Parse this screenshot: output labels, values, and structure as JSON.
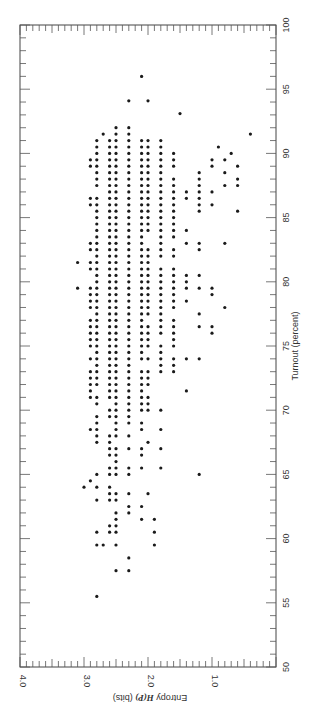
{
  "chart_data": {
    "type": "scatter",
    "title": "",
    "orientation": "rotated-90-clockwise",
    "xlabel": "Turnout (percent)",
    "ylabel": "Entropy H(P) (bits)",
    "xlim": [
      50,
      100
    ],
    "ylim": [
      0,
      4.0
    ],
    "x_ticks": [
      50,
      55,
      60,
      65,
      70,
      75,
      80,
      85,
      90,
      95,
      100
    ],
    "y_ticks": [
      1.0,
      2.0,
      3.0,
      4.0
    ],
    "y_tick_labels": [
      "1.0",
      "2.0",
      "3.0",
      "4.0"
    ],
    "x_tick_labels": [
      "50",
      "55",
      "60",
      "65",
      "70",
      "75",
      "80",
      "85",
      "90",
      "95",
      "100"
    ],
    "grid": false,
    "legend": null,
    "rows": [
      {
        "turnout": 96.0,
        "entropy": [
          2.1
        ]
      },
      {
        "turnout": 94.1,
        "entropy": [
          2.3,
          2.0
        ]
      },
      {
        "turnout": 93.1,
        "entropy": [
          1.5
        ]
      },
      {
        "turnout": 92.0,
        "entropy": [
          2.3,
          2.5
        ]
      },
      {
        "turnout": 91.5,
        "entropy": [
          2.3,
          2.5,
          2.7,
          0.4
        ]
      },
      {
        "turnout": 91.0,
        "entropy": [
          2.8,
          2.6,
          2.5,
          2.3,
          2.1,
          2.0,
          1.8
        ]
      },
      {
        "turnout": 90.5,
        "entropy": [
          2.8,
          2.6,
          2.5,
          2.3,
          2.1,
          2.0,
          1.8,
          0.9
        ]
      },
      {
        "turnout": 90.0,
        "entropy": [
          2.8,
          2.6,
          2.5,
          2.3,
          2.1,
          2.0,
          1.8,
          1.6,
          0.7
        ]
      },
      {
        "turnout": 89.5,
        "entropy": [
          2.9,
          2.8,
          2.6,
          2.5,
          2.3,
          2.1,
          2.0,
          1.8,
          1.6,
          1.0,
          0.8
        ]
      },
      {
        "turnout": 89.0,
        "entropy": [
          2.9,
          2.8,
          2.6,
          2.5,
          2.3,
          2.1,
          2.0,
          1.8,
          1.6,
          1.0,
          0.6
        ]
      },
      {
        "turnout": 88.5,
        "entropy": [
          2.8,
          2.6,
          2.5,
          2.3,
          2.1,
          2.0,
          1.8,
          1.2,
          0.8
        ]
      },
      {
        "turnout": 88.0,
        "entropy": [
          2.8,
          2.6,
          2.5,
          2.3,
          2.1,
          2.0,
          1.8,
          1.6,
          1.2,
          0.6
        ]
      },
      {
        "turnout": 87.5,
        "entropy": [
          2.8,
          2.6,
          2.5,
          2.3,
          2.1,
          2.0,
          1.8,
          1.6,
          1.2,
          0.8,
          0.6
        ]
      },
      {
        "turnout": 87.0,
        "entropy": [
          2.6,
          2.5,
          2.3,
          2.1,
          2.0,
          1.8,
          1.6,
          1.4,
          1.2,
          1.0
        ]
      },
      {
        "turnout": 86.5,
        "entropy": [
          2.9,
          2.8,
          2.6,
          2.5,
          2.3,
          2.1,
          2.0,
          1.8,
          1.6,
          1.4,
          1.2
        ]
      },
      {
        "turnout": 86.0,
        "entropy": [
          2.9,
          2.8,
          2.6,
          2.5,
          2.3,
          2.1,
          2.0,
          1.8,
          1.6,
          1.2,
          1.0
        ]
      },
      {
        "turnout": 85.5,
        "entropy": [
          2.8,
          2.6,
          2.5,
          2.3,
          2.1,
          2.0,
          1.8,
          1.6,
          1.2,
          0.6
        ]
      },
      {
        "turnout": 85.0,
        "entropy": [
          2.8,
          2.6,
          2.5,
          2.3,
          2.1,
          2.0,
          1.8,
          1.6
        ]
      },
      {
        "turnout": 84.5,
        "entropy": [
          2.8,
          2.6,
          2.5,
          2.3,
          2.1,
          2.0,
          1.8,
          1.6
        ]
      },
      {
        "turnout": 84.0,
        "entropy": [
          2.8,
          2.6,
          2.5,
          2.3,
          2.1,
          2.0,
          1.8,
          1.6,
          1.4
        ]
      },
      {
        "turnout": 83.5,
        "entropy": [
          2.8,
          2.6,
          2.5,
          2.3,
          2.1,
          1.8,
          1.6
        ]
      },
      {
        "turnout": 83.0,
        "entropy": [
          2.9,
          2.8,
          2.6,
          2.5,
          2.3,
          2.1,
          1.8,
          1.4,
          1.2,
          0.8
        ]
      },
      {
        "turnout": 82.5,
        "entropy": [
          2.9,
          2.8,
          2.6,
          2.5,
          2.3,
          2.1,
          2.0,
          1.8,
          1.6,
          1.2
        ]
      },
      {
        "turnout": 82.0,
        "entropy": [
          2.8,
          2.6,
          2.5,
          2.3,
          2.1,
          2.0,
          1.8,
          1.6
        ]
      },
      {
        "turnout": 81.5,
        "entropy": [
          3.1,
          2.9,
          2.8,
          2.6,
          2.5,
          2.3,
          2.1,
          2.0
        ]
      },
      {
        "turnout": 81.0,
        "entropy": [
          2.9,
          2.8,
          2.6,
          2.5,
          2.3,
          2.1,
          2.0,
          1.8,
          1.6
        ]
      },
      {
        "turnout": 80.5,
        "entropy": [
          2.8,
          2.6,
          2.5,
          2.3,
          2.1,
          2.0,
          1.8,
          1.6,
          1.4,
          1.2
        ]
      },
      {
        "turnout": 80.0,
        "entropy": [
          2.8,
          2.6,
          2.5,
          2.3,
          2.1,
          2.0,
          1.8,
          1.6,
          1.4
        ]
      },
      {
        "turnout": 79.5,
        "entropy": [
          3.1,
          2.9,
          2.8,
          2.6,
          2.5,
          2.3,
          2.1,
          2.0,
          1.8,
          1.6,
          1.4,
          1.2,
          1.0
        ]
      },
      {
        "turnout": 79.0,
        "entropy": [
          2.9,
          2.8,
          2.6,
          2.5,
          2.3,
          2.1,
          2.0,
          1.8,
          1.6,
          1.0
        ]
      },
      {
        "turnout": 78.5,
        "entropy": [
          2.9,
          2.8,
          2.6,
          2.5,
          2.3,
          2.1,
          2.0,
          1.8,
          1.6,
          1.4
        ]
      },
      {
        "turnout": 78.0,
        "entropy": [
          2.9,
          2.8,
          2.6,
          2.5,
          2.3,
          2.1,
          2.0,
          1.8,
          1.6,
          0.8
        ]
      },
      {
        "turnout": 77.5,
        "entropy": [
          2.8,
          2.6,
          2.5,
          2.3,
          2.1,
          2.0,
          1.8,
          1.2
        ]
      },
      {
        "turnout": 77.0,
        "entropy": [
          2.9,
          2.8,
          2.6,
          2.5,
          2.3,
          2.1,
          1.8,
          1.6
        ]
      },
      {
        "turnout": 76.5,
        "entropy": [
          2.9,
          2.8,
          2.6,
          2.5,
          2.3,
          2.1,
          2.0,
          1.8,
          1.6,
          1.2,
          1.0
        ]
      },
      {
        "turnout": 76.0,
        "entropy": [
          2.9,
          2.8,
          2.6,
          2.5,
          2.3,
          2.1,
          2.0,
          1.8,
          1.6,
          1.0
        ]
      },
      {
        "turnout": 75.5,
        "entropy": [
          2.9,
          2.8,
          2.6,
          2.5,
          2.3,
          2.1,
          2.0,
          1.6
        ]
      },
      {
        "turnout": 75.0,
        "entropy": [
          2.9,
          2.8,
          2.6,
          2.5,
          2.3,
          2.1,
          2.0,
          1.8,
          1.6
        ]
      },
      {
        "turnout": 74.5,
        "entropy": [
          2.8,
          2.6,
          2.5,
          2.3,
          2.1,
          1.8
        ]
      },
      {
        "turnout": 74.0,
        "entropy": [
          2.9,
          2.8,
          2.6,
          2.5,
          2.3,
          2.1,
          2.0,
          1.8,
          1.6,
          1.4,
          1.2
        ]
      },
      {
        "turnout": 73.5,
        "entropy": [
          2.8,
          2.6,
          2.5,
          2.3,
          1.8,
          1.6
        ]
      },
      {
        "turnout": 73.0,
        "entropy": [
          2.9,
          2.8,
          2.6,
          2.5,
          2.3,
          2.1,
          2.0,
          1.8,
          1.6
        ]
      },
      {
        "turnout": 72.5,
        "entropy": [
          2.9,
          2.8,
          2.6,
          2.5,
          2.3,
          2.1,
          2.0
        ]
      },
      {
        "turnout": 72.0,
        "entropy": [
          2.9,
          2.8,
          2.6,
          2.5,
          2.3,
          2.1,
          2.0
        ]
      },
      {
        "turnout": 71.5,
        "entropy": [
          2.9,
          2.6,
          2.5,
          2.3,
          2.1,
          1.4
        ]
      },
      {
        "turnout": 71.0,
        "entropy": [
          2.9,
          2.8,
          2.6,
          2.5,
          2.3,
          2.1,
          2.0
        ]
      },
      {
        "turnout": 70.5,
        "entropy": [
          2.8,
          2.5,
          2.3,
          2.1,
          2.0
        ]
      },
      {
        "turnout": 70.0,
        "entropy": [
          2.6,
          2.5,
          2.3,
          2.1,
          2.0,
          1.8
        ]
      },
      {
        "turnout": 69.5,
        "entropy": [
          2.8,
          2.6,
          2.5,
          2.3
        ]
      },
      {
        "turnout": 69.0,
        "entropy": [
          2.8,
          2.5,
          2.3,
          2.1
        ]
      },
      {
        "turnout": 68.5,
        "entropy": [
          2.9,
          2.8,
          2.5,
          2.1,
          1.8
        ]
      },
      {
        "turnout": 68.0,
        "entropy": [
          2.8,
          2.6,
          2.5,
          2.3
        ]
      },
      {
        "turnout": 67.5,
        "entropy": [
          2.8,
          2.6,
          2.0
        ]
      },
      {
        "turnout": 67.0,
        "entropy": [
          2.6,
          2.5,
          2.3,
          2.1,
          1.8
        ]
      },
      {
        "turnout": 66.5,
        "entropy": [
          2.6,
          2.5,
          2.1
        ]
      },
      {
        "turnout": 66.0,
        "entropy": [
          2.5
        ]
      },
      {
        "turnout": 65.5,
        "entropy": [
          2.6,
          2.5,
          2.3,
          2.1,
          1.8
        ]
      },
      {
        "turnout": 65.0,
        "entropy": [
          2.8,
          2.6,
          2.5,
          2.3,
          1.2
        ]
      },
      {
        "turnout": 64.5,
        "entropy": [
          2.9
        ]
      },
      {
        "turnout": 64.0,
        "entropy": [
          3.0,
          2.8,
          2.6
        ]
      },
      {
        "turnout": 63.5,
        "entropy": [
          2.6,
          2.5,
          2.3,
          2.0
        ]
      },
      {
        "turnout": 63.0,
        "entropy": [
          2.8,
          2.6,
          2.5
        ]
      },
      {
        "turnout": 62.5,
        "entropy": [
          2.3,
          2.1
        ]
      },
      {
        "turnout": 62.0,
        "entropy": [
          2.5,
          2.3
        ]
      },
      {
        "turnout": 61.5,
        "entropy": [
          2.5,
          2.1,
          1.9
        ]
      },
      {
        "turnout": 61.0,
        "entropy": [
          2.6,
          2.5
        ]
      },
      {
        "turnout": 60.5,
        "entropy": [
          2.8,
          2.6,
          2.5,
          1.9
        ]
      },
      {
        "turnout": 59.5,
        "entropy": [
          2.8,
          2.7,
          2.5,
          1.9
        ]
      },
      {
        "turnout": 58.5,
        "entropy": [
          2.3
        ]
      },
      {
        "turnout": 57.5,
        "entropy": [
          2.5,
          2.3
        ]
      },
      {
        "turnout": 55.5,
        "entropy": [
          2.8
        ]
      }
    ]
  },
  "axes": {
    "turnout_label": "Turnout (percent)",
    "entropy_label_prefix": "Entropy ",
    "entropy_label_var": "H(P)",
    "entropy_label_suffix": " (bits)"
  }
}
